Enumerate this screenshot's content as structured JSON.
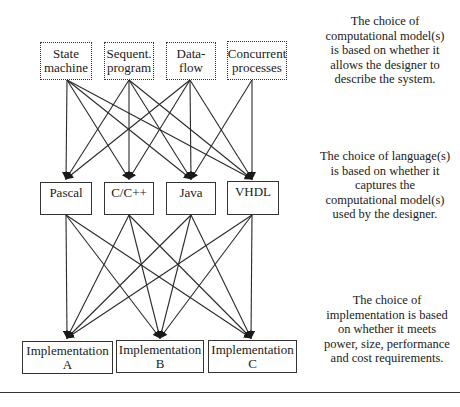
{
  "models": [
    {
      "id": "state-machine",
      "label": "State machine"
    },
    {
      "id": "sequent-program",
      "label": "Sequent. program"
    },
    {
      "id": "data-flow",
      "label": "Data- flow"
    },
    {
      "id": "concurrent-processes",
      "label": "Concurrent processes"
    }
  ],
  "languages": [
    {
      "id": "pascal",
      "label": "Pascal"
    },
    {
      "id": "c-cpp",
      "label": "C/C++"
    },
    {
      "id": "java",
      "label": "Java"
    },
    {
      "id": "vhdl",
      "label": "VHDL"
    }
  ],
  "implementations": [
    {
      "id": "impl-a",
      "label": "Implementation A"
    },
    {
      "id": "impl-b",
      "label": "Implementation B"
    },
    {
      "id": "impl-c",
      "label": "Implementation C"
    }
  ],
  "notes": {
    "models": "The choice of computational model(s) is based on whether it allows the designer to describe the system.",
    "languages": "The choice of language(s) is based on whether it captures the computational model(s) used by the designer.",
    "implementations": "The choice of implementation is based on whether it meets power, size, performance and cost requirements."
  },
  "edges": {
    "model_to_language": [
      [
        "state-machine",
        "pascal"
      ],
      [
        "state-machine",
        "c-cpp"
      ],
      [
        "state-machine",
        "java"
      ],
      [
        "state-machine",
        "vhdl"
      ],
      [
        "sequent-program",
        "pascal"
      ],
      [
        "sequent-program",
        "c-cpp"
      ],
      [
        "sequent-program",
        "java"
      ],
      [
        "sequent-program",
        "vhdl"
      ],
      [
        "data-flow",
        "pascal"
      ],
      [
        "data-flow",
        "c-cpp"
      ],
      [
        "data-flow",
        "java"
      ],
      [
        "data-flow",
        "vhdl"
      ],
      [
        "concurrent-processes",
        "java"
      ],
      [
        "concurrent-processes",
        "vhdl"
      ]
    ],
    "language_to_implementation": [
      [
        "pascal",
        "impl-a"
      ],
      [
        "pascal",
        "impl-b"
      ],
      [
        "pascal",
        "impl-c"
      ],
      [
        "c-cpp",
        "impl-a"
      ],
      [
        "c-cpp",
        "impl-b"
      ],
      [
        "c-cpp",
        "impl-c"
      ],
      [
        "java",
        "impl-a"
      ],
      [
        "java",
        "impl-b"
      ],
      [
        "java",
        "impl-c"
      ],
      [
        "vhdl",
        "impl-a"
      ],
      [
        "vhdl",
        "impl-b"
      ],
      [
        "vhdl",
        "impl-c"
      ]
    ]
  },
  "colors": {
    "line": "#2a2a2a",
    "border": "#333333",
    "text": "#1a1a1a"
  }
}
